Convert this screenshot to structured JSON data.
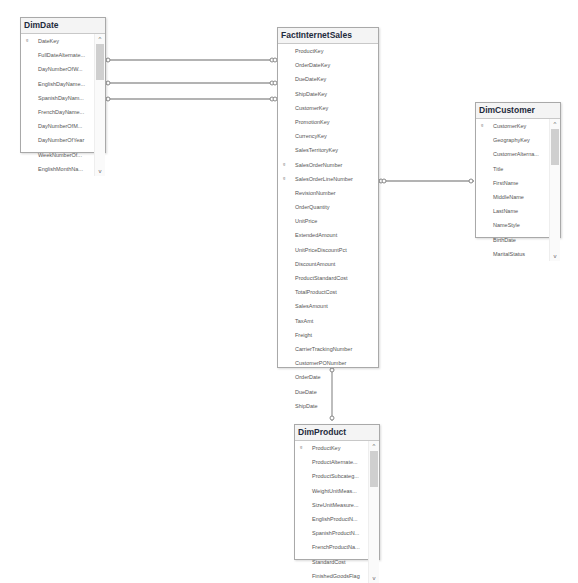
{
  "tables": {
    "dimdate": {
      "title": "DimDate",
      "columns": [
        "DateKey",
        "FullDateAlternate...",
        "DayNumberOfW...",
        "EnglishDayName...",
        "SpanishDayNam...",
        "FrenchDayName...",
        "DayNumberOfM...",
        "DayNumberOfYear",
        "WeekNumberOf...",
        "EnglishMonthNa..."
      ],
      "key_column": "DateKey"
    },
    "fact": {
      "title": "FactInternetSales",
      "columns": [
        "ProductKey",
        "OrderDateKey",
        "DueDateKey",
        "ShipDateKey",
        "CustomerKey",
        "PromotionKey",
        "CurrencyKey",
        "SalesTerritoryKey",
        "SalesOrderNumber",
        "SalesOrderLineNumber",
        "RevisionNumber",
        "OrderQuantity",
        "UnitPrice",
        "ExtendedAmount",
        "UnitPriceDiscountPct",
        "DiscountAmount",
        "ProductStandardCost",
        "TotalProductCost",
        "SalesAmount",
        "TaxAmt",
        "Freight",
        "CarrierTrackingNumber",
        "CustomerPONumber",
        "OrderDate",
        "DueDate",
        "ShipDate"
      ],
      "key_columns": [
        "SalesOrderNumber",
        "SalesOrderLineNumber"
      ]
    },
    "customer": {
      "title": "DimCustomer",
      "columns": [
        "CustomerKey",
        "GeographyKey",
        "CustomerAlterna...",
        "Title",
        "FirstName",
        "MiddleName",
        "LastName",
        "NameStyle",
        "BirthDate",
        "MaritalStatus"
      ],
      "key_column": "CustomerKey"
    },
    "product": {
      "title": "DimProduct",
      "columns": [
        "ProductKey",
        "ProductAlternate...",
        "ProductSubcateg...",
        "WeightUnitMeas...",
        "SizeUnitMeasure...",
        "EnglishProductN...",
        "SpanishProductN...",
        "FrenchProductNa...",
        "StandardCost",
        "FinishedGoodsFlag"
      ],
      "key_column": "ProductKey"
    }
  },
  "icons": {
    "key": "🔑",
    "scroll_up": "^",
    "scroll_down": "v"
  },
  "relationships": [
    {
      "from": "FactInternetSales",
      "to": "DimDate",
      "via": "OrderDateKey"
    },
    {
      "from": "FactInternetSales",
      "to": "DimDate",
      "via": "DueDateKey"
    },
    {
      "from": "FactInternetSales",
      "to": "DimDate",
      "via": "ShipDateKey"
    },
    {
      "from": "FactInternetSales",
      "to": "DimCustomer",
      "via": "CustomerKey"
    },
    {
      "from": "FactInternetSales",
      "to": "DimProduct",
      "via": "ProductKey"
    }
  ]
}
